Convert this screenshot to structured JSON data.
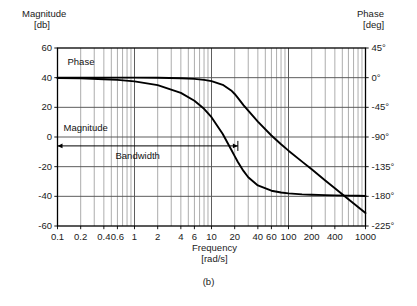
{
  "figure": {
    "caption": "(b)",
    "left_axis_title_line1": "Magnitude",
    "left_axis_title_line2": "[db]",
    "right_axis_title_line1": "Phase",
    "right_axis_title_line2": "[deg]",
    "x_axis_title_line1": "Frequency",
    "x_axis_title_line2": "[rad/s]",
    "annotations": {
      "phase_label": "Phase",
      "magnitude_label": "Magnitude",
      "bandwidth_label": "Bandwidth"
    },
    "colors": {
      "curve": "#000000",
      "grid_major": "#555555",
      "grid_minor": "#8a8a8a",
      "frame": "#000000",
      "background": "#ffffff",
      "text": "#111111"
    }
  },
  "chart_data": {
    "type": "line",
    "title": "",
    "subtitle": "",
    "xlabel": "Frequency [rad/s]",
    "ylabel": "Magnitude [db]",
    "y2label": "Phase [deg]",
    "xscale": "log",
    "xlim": [
      0.1,
      1000
    ],
    "ylim": [
      -60,
      60
    ],
    "y2lim": [
      -225,
      45
    ],
    "grid": true,
    "legend": false,
    "x_ticks": [
      0.1,
      0.2,
      0.4,
      0.6,
      1,
      2,
      4,
      6,
      10,
      20,
      40,
      60,
      100,
      200,
      400,
      1000
    ],
    "x_tick_labels": [
      "0.1",
      "0.2",
      "0.4",
      "0.6",
      "1",
      "2",
      "4",
      "6",
      "10",
      "20",
      "40",
      "60",
      "100",
      "200",
      "400",
      "1000"
    ],
    "y_ticks": [
      60,
      40,
      20,
      0,
      -20,
      -40,
      -60
    ],
    "y_tick_labels": [
      "60",
      "40",
      "20",
      "0",
      "-20",
      "-40",
      "-60"
    ],
    "y2_ticks": [
      45,
      0,
      -45,
      -90,
      -135,
      -180,
      -225
    ],
    "y2_tick_labels": [
      "45°",
      "0°",
      "-45°",
      "-90°",
      "-135°",
      "-180°",
      "-225°"
    ],
    "minor_gridlines_x": [
      0.1,
      0.2,
      0.3,
      0.4,
      0.5,
      0.6,
      0.7,
      0.8,
      0.9,
      1,
      2,
      3,
      4,
      5,
      6,
      7,
      8,
      9,
      10,
      20,
      30,
      40,
      50,
      60,
      70,
      80,
      90,
      100,
      200,
      300,
      400,
      500,
      600,
      700,
      800,
      900,
      1000
    ],
    "bandwidth_marker": {
      "from": 0.1,
      "to": 22,
      "y_db": -6,
      "label": "Bandwidth"
    },
    "series": [
      {
        "name": "Magnitude",
        "axis": "left",
        "units": "db",
        "x": [
          0.1,
          0.2,
          0.4,
          0.6,
          1,
          2,
          4,
          6,
          8,
          10,
          14,
          18,
          20,
          22,
          26,
          30,
          40,
          60,
          80,
          100,
          150,
          200,
          300,
          400,
          600,
          800,
          1000
        ],
        "y": [
          40.0,
          40.0,
          40.0,
          40.0,
          40.0,
          39.9,
          39.6,
          39.2,
          38.5,
          37.7,
          35.2,
          31.4,
          29.0,
          26.4,
          21.5,
          17.7,
          10.4,
          1.0,
          -4.9,
          -9.2,
          -16.6,
          -21.8,
          -29.3,
          -34.5,
          -41.9,
          -47.2,
          -51.3
        ]
      },
      {
        "name": "Phase",
        "axis": "right",
        "units": "deg",
        "x": [
          0.1,
          0.2,
          0.4,
          0.6,
          1,
          2,
          4,
          6,
          8,
          10,
          14,
          18,
          20,
          22,
          26,
          30,
          40,
          60,
          80,
          100,
          150,
          200,
          300,
          400,
          600,
          800,
          1000
        ],
        "y": [
          -0.6,
          -1.1,
          -2.3,
          -3.4,
          -5.7,
          -11.4,
          -23.0,
          -35.0,
          -47.3,
          -60.0,
          -85.5,
          -109.0,
          -119.0,
          -128.0,
          -141.5,
          -151.0,
          -163.5,
          -171.5,
          -174.2,
          -175.5,
          -177.0,
          -177.6,
          -178.2,
          -178.6,
          -179.0,
          -179.2,
          -179.4
        ]
      }
    ]
  }
}
